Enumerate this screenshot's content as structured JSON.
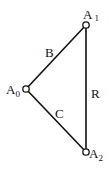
{
  "diagram": {
    "type": "graph",
    "background": "#ffffff",
    "line_color": "#111111",
    "nodes": [
      {
        "id": "A0",
        "base": "A",
        "sub": "0",
        "x": 26,
        "y": 89
      },
      {
        "id": "A1",
        "base": "A",
        "sub": "1",
        "x": 86,
        "y": 25
      },
      {
        "id": "A2",
        "base": "A",
        "sub": "2",
        "x": 86,
        "y": 152
      }
    ],
    "edges": [
      {
        "from": "A0",
        "to": "A1",
        "label": "B"
      },
      {
        "from": "A0",
        "to": "A2",
        "label": "C"
      },
      {
        "from": "A1",
        "to": "A2",
        "label": "R"
      }
    ]
  }
}
